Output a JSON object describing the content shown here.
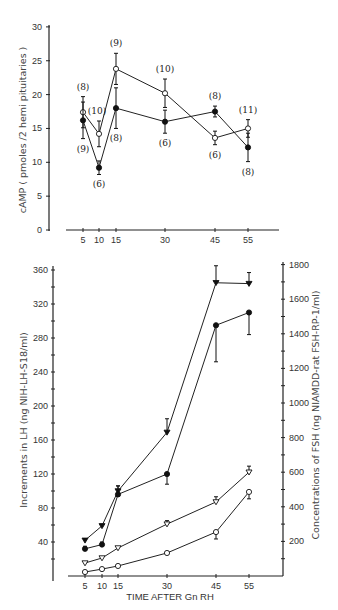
{
  "chart_data": [
    {
      "type": "line",
      "title": "",
      "xlabel": "",
      "ylabel": "cAMP  ( pmoles /2 hemi pituitaries )",
      "x": [
        5,
        10,
        15,
        30,
        45,
        55
      ],
      "xticks": [
        "5",
        "10",
        "15",
        "30",
        "45",
        "55"
      ],
      "yticks": [
        "0",
        "5",
        "10",
        "15",
        "20",
        "25",
        "30"
      ],
      "ylim": [
        0,
        30
      ],
      "grid": false,
      "series": [
        {
          "name": "open circles",
          "marker": "open-circle",
          "values": [
            17.4,
            14.2,
            23.8,
            20.2,
            13.6,
            15.0
          ],
          "errors": [
            2.3,
            1.9,
            2.3,
            2.1,
            1.0,
            1.3
          ],
          "n_labels": [
            "(8)",
            "(10)",
            "(9)",
            "(10)",
            "(6)",
            "(11)"
          ]
        },
        {
          "name": "filled circles",
          "marker": "filled-circle",
          "values": [
            16.2,
            9.2,
            18.0,
            16.0,
            17.5,
            12.2
          ],
          "errors": [
            2.7,
            1.0,
            3.0,
            1.7,
            0.8,
            2.1
          ],
          "n_labels": [
            "(9)",
            "(6)",
            "(8)",
            "(6)",
            "(8)",
            "(8)"
          ]
        }
      ]
    },
    {
      "type": "line",
      "title": "",
      "xlabel": "TIME AFTER Gn RH",
      "ylabel": "Increments in LH (ng NIH-LH-S18/ml)",
      "ylabel_right": "Concentrations of FSH (ng NIAMDD-rat FSH-RP-1/ml)",
      "x": [
        5,
        10,
        15,
        30,
        45,
        55
      ],
      "xticks": [
        "5",
        "10",
        "15",
        "30",
        "45",
        "55"
      ],
      "yticks": [
        "40",
        "80",
        "120",
        "160",
        "200",
        "240",
        "280",
        "320",
        "360"
      ],
      "yticks_right": [
        "200",
        "400",
        "600",
        "800",
        "1000",
        "1200",
        "1400",
        "1600",
        "1800"
      ],
      "ylim": [
        0,
        360
      ],
      "ylim_right": [
        0,
        1800
      ],
      "grid": false,
      "series": [
        {
          "name": "LH filled triangles",
          "axis": "left",
          "marker": "filled-triangle-down",
          "values": [
            42,
            59,
            100,
            169,
            345,
            344
          ],
          "errors": [
            0,
            2,
            6,
            16,
            20,
            13
          ]
        },
        {
          "name": "LH filled circles",
          "axis": "left",
          "marker": "filled-circle",
          "values": [
            32,
            37,
            96,
            120,
            295,
            310
          ],
          "errors": [
            3,
            3,
            10,
            12,
            43,
            26
          ]
        },
        {
          "name": "FSH open triangles",
          "axis": "right",
          "marker": "open-triangle-down",
          "values": [
            75,
            104,
            162,
            300,
            428,
            600
          ],
          "errors": [
            0,
            0,
            8,
            20,
            30,
            35
          ]
        },
        {
          "name": "FSH open circles",
          "axis": "right",
          "marker": "open-circle",
          "values": [
            23,
            40,
            58,
            133,
            254,
            486
          ],
          "errors": [
            0,
            0,
            0,
            0,
            40,
            40
          ]
        }
      ]
    }
  ]
}
